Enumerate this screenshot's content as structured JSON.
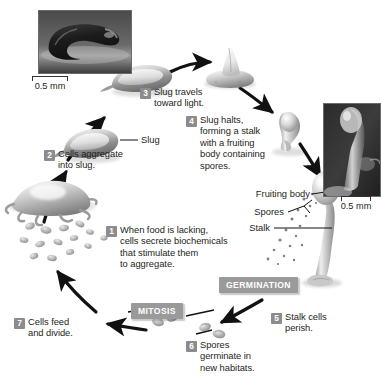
{
  "figure": {
    "background_color": "#ffffff",
    "badge_color": "#9a9a9a",
    "step_number_color": "#8c8c8c",
    "text_color": "#231f20"
  },
  "steps": [
    {
      "number": "1",
      "text": "When food is lacking, cells secrete biochemicals that stimulate them to aggregate.",
      "lines": [
        "When food is lacking,",
        "cells secrete biochemicals",
        "that stimulate them",
        "to aggregate."
      ]
    },
    {
      "number": "2",
      "text": "Cells aggregate into slug.",
      "lines": [
        "Cells aggregate",
        "into slug."
      ]
    },
    {
      "number": "3",
      "text": "Slug travels toward light.",
      "lines": [
        "Slug travels",
        "toward light."
      ]
    },
    {
      "number": "4",
      "text": "Slug halts, forming a stalk with a fruiting body containing spores.",
      "lines": [
        "Slug halts,",
        "forming a stalk",
        "with a fruiting",
        "body containing",
        "spores."
      ]
    },
    {
      "number": "5",
      "text": "Stalk cells perish.",
      "lines": [
        "Stalk cells",
        "perish."
      ]
    },
    {
      "number": "6",
      "text": "Spores germinate in new habitats.",
      "lines": [
        "Spores",
        "germinate in",
        "new habitats."
      ]
    },
    {
      "number": "7",
      "text": "Cells feed and divide.",
      "lines": [
        "Cells feed",
        "and divide."
      ]
    }
  ],
  "badges": [
    {
      "id": "mitosis",
      "label": "MITOSIS"
    },
    {
      "id": "germination",
      "label": "GERMINATION"
    }
  ],
  "part_labels": [
    {
      "id": "slug",
      "label": "Slug"
    },
    {
      "id": "fruiting-body",
      "label": "Fruiting body"
    },
    {
      "id": "spores",
      "label": "Spores"
    },
    {
      "id": "stalk",
      "label": "Stalk"
    }
  ],
  "scale_bars": [
    {
      "id": "scale-left",
      "label": "0.5 mm"
    },
    {
      "id": "scale-right",
      "label": "0.5 mm"
    }
  ],
  "photos": [
    {
      "id": "photo-slug",
      "caption": "0.5 mm",
      "subject": "migrating slug micrograph"
    },
    {
      "id": "photo-fruiting-body",
      "caption": "0.5 mm",
      "subject": "fruiting body micrograph"
    }
  ]
}
